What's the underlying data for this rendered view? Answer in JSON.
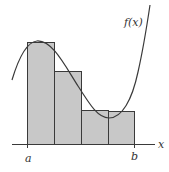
{
  "diagram": {
    "type": "riemann-sum",
    "function_label": "f(x)",
    "axis_label": "x",
    "interval_start_label": "a",
    "interval_end_label": "b",
    "rectangle_count": 4,
    "colors": {
      "rectangle_fill": "#c8c8c8",
      "stroke": "#3a3a3a",
      "background": "#ffffff"
    }
  }
}
